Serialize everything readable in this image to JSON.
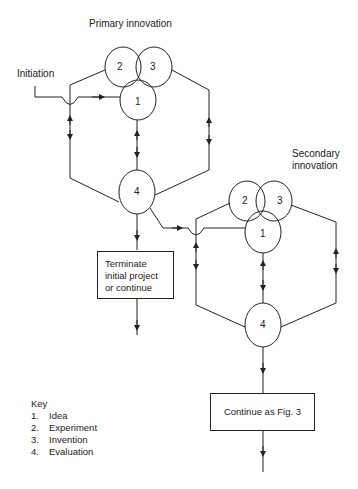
{
  "diagram": {
    "primary": {
      "title": "Primary innovation",
      "nodes": {
        "n1": "1",
        "n2": "2",
        "n3": "3",
        "n4": "4"
      }
    },
    "secondary": {
      "title_line1": "Secondary",
      "title_line2": "innovation",
      "nodes": {
        "n1": "1",
        "n2": "2",
        "n3": "3",
        "n4": "4"
      }
    },
    "initiation_label": "Initiation",
    "terminate_box": {
      "line1": "Terminate",
      "line2": "initial project",
      "line3": "or continue"
    },
    "continue_box": "Continue as Fig. 3",
    "key": {
      "title": "Key",
      "items": [
        {
          "num": "1.",
          "label": "Idea"
        },
        {
          "num": "2.",
          "label": "Experiment"
        },
        {
          "num": "3.",
          "label": "Invention"
        },
        {
          "num": "4.",
          "label": "Evaluation"
        }
      ]
    }
  }
}
